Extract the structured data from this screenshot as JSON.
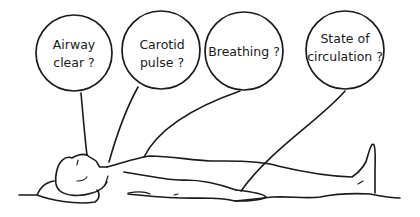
{
  "diagram": {
    "ink_color": "#1a1a1a",
    "background": "#ffffff",
    "callouts": [
      {
        "id": "airway",
        "lines": [
          "Airway",
          "clear ?"
        ],
        "points_to": "mouth"
      },
      {
        "id": "carotid",
        "lines": [
          "Carotid",
          "pulse ?"
        ],
        "points_to": "neck"
      },
      {
        "id": "breathing",
        "lines": [
          "Breathing ?"
        ],
        "points_to": "chest"
      },
      {
        "id": "circulation",
        "lines": [
          "State of",
          "circulation ?"
        ],
        "points_to": "hand"
      }
    ]
  }
}
